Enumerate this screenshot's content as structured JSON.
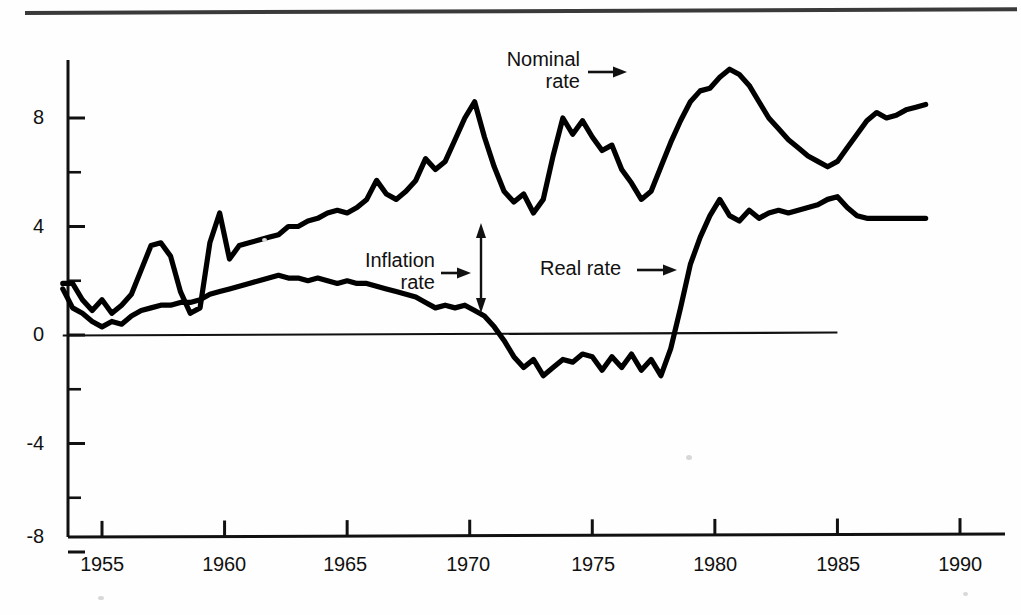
{
  "figure": {
    "has_top_rule": true,
    "background_color": "#fefefe",
    "line_color": "#000000",
    "axis_color": "#111111"
  },
  "annotations": [
    {
      "name": "nominal-rate",
      "line1": "Nominal",
      "line2": "rate",
      "arrow": "right-arrow"
    },
    {
      "name": "inflation-rate",
      "line1": "Inflation",
      "line2": "rate",
      "arrow": "right-arrow"
    },
    {
      "name": "real-rate",
      "line1": "Real rate",
      "line2": "",
      "arrow": "right-arrow"
    }
  ],
  "chart_data": {
    "type": "line",
    "title": "",
    "subtitle": "",
    "xlabel": "",
    "ylabel": "",
    "xlim": [
      1953.4,
      1990.0
    ],
    "ylim": [
      -8,
      10
    ],
    "grid": false,
    "legend": "inline-annotations",
    "x_ticks": [
      1955,
      1960,
      1965,
      1970,
      1975,
      1980,
      1985,
      1990
    ],
    "x_tick_labels": [
      "1955",
      "1960",
      "1965",
      "1970",
      "1975",
      "1980",
      "1985",
      "1990"
    ],
    "y_ticks": [
      -8,
      -6,
      -4,
      -2,
      0,
      2,
      4,
      6,
      8
    ],
    "y_tick_labels": [
      "-8",
      "",
      "-4",
      "",
      "0",
      "",
      "4",
      "",
      "8"
    ],
    "y_major_labeled": [
      "8",
      "4",
      "0",
      "-4",
      "-8"
    ],
    "zero_line": {
      "value": 0,
      "x_start": 1953.4,
      "x_end": 1985.0
    },
    "series": [
      {
        "name": "Nominal rate",
        "x": [
          1953.4,
          1953.8,
          1954.2,
          1954.6,
          1955.0,
          1955.4,
          1955.8,
          1956.2,
          1956.6,
          1957.0,
          1957.4,
          1957.8,
          1958.2,
          1958.6,
          1959.0,
          1959.4,
          1959.8,
          1960.2,
          1960.6,
          1961.0,
          1961.4,
          1961.8,
          1962.2,
          1962.6,
          1963.0,
          1963.4,
          1963.8,
          1964.2,
          1964.6,
          1965.0,
          1965.4,
          1965.8,
          1966.2,
          1966.6,
          1967.0,
          1967.4,
          1967.8,
          1968.2,
          1968.6,
          1969.0,
          1969.4,
          1969.8,
          1970.2,
          1970.6,
          1971.0,
          1971.4,
          1971.8,
          1972.2,
          1972.6,
          1973.0,
          1973.4,
          1973.8,
          1974.2,
          1974.6,
          1975.0,
          1975.4,
          1975.8,
          1976.2,
          1976.6,
          1977.0,
          1977.4,
          1977.8,
          1978.2,
          1978.6,
          1979.0,
          1979.4,
          1979.8,
          1980.2,
          1980.6,
          1981.0,
          1981.4,
          1981.8,
          1982.2,
          1982.6,
          1983.0,
          1983.4,
          1983.8,
          1984.2,
          1984.6,
          1985.0,
          1985.4,
          1985.8,
          1986.2,
          1986.6,
          1987.0,
          1987.4,
          1987.8,
          1988.2,
          1988.6
        ],
        "y": [
          1.9,
          1.9,
          1.3,
          0.9,
          1.3,
          0.8,
          1.1,
          1.5,
          2.4,
          3.3,
          3.4,
          2.9,
          1.6,
          0.8,
          1.0,
          3.4,
          4.5,
          2.8,
          3.3,
          3.4,
          3.5,
          3.6,
          3.7,
          4.0,
          4.0,
          4.2,
          4.3,
          4.5,
          4.6,
          4.5,
          4.7,
          5.0,
          5.7,
          5.2,
          5.0,
          5.3,
          5.7,
          6.5,
          6.1,
          6.4,
          7.2,
          8.0,
          8.6,
          7.3,
          6.2,
          5.3,
          4.9,
          5.2,
          4.5,
          5.0,
          6.6,
          8.0,
          7.4,
          7.9,
          7.3,
          6.8,
          7.0,
          6.1,
          5.6,
          5.0,
          5.3,
          6.2,
          7.1,
          7.9,
          8.6,
          9.0,
          9.1,
          9.5,
          9.8,
          9.6,
          9.2,
          8.6,
          8.0,
          7.6,
          7.2,
          6.9,
          6.6,
          6.4,
          6.2,
          6.4,
          6.9,
          7.4,
          7.9,
          8.2,
          8.0,
          8.1,
          8.3,
          8.4,
          8.5
        ]
      },
      {
        "name": "Inflation rate / Real rate boundary series",
        "x": [
          1953.4,
          1953.8,
          1954.2,
          1954.6,
          1955.0,
          1955.4,
          1955.8,
          1956.2,
          1956.6,
          1957.0,
          1957.4,
          1957.8,
          1958.2,
          1958.6,
          1959.0,
          1959.4,
          1959.8,
          1960.2,
          1960.6,
          1961.0,
          1961.4,
          1961.8,
          1962.2,
          1962.6,
          1963.0,
          1963.4,
          1963.8,
          1964.2,
          1964.6,
          1965.0,
          1965.4,
          1965.8,
          1966.2,
          1966.6,
          1967.0,
          1967.4,
          1967.8,
          1968.2,
          1968.6,
          1969.0,
          1969.4,
          1969.8,
          1970.2,
          1970.6,
          1971.0,
          1971.4,
          1971.8,
          1972.2,
          1972.6,
          1973.0,
          1973.4,
          1973.8,
          1974.2,
          1974.6,
          1975.0,
          1975.4,
          1975.8,
          1976.2,
          1976.6,
          1977.0,
          1977.4,
          1977.8,
          1978.2,
          1978.6,
          1979.0,
          1979.4,
          1979.8,
          1980.2,
          1980.6,
          1981.0,
          1981.4,
          1981.8,
          1982.2,
          1982.6,
          1983.0,
          1983.4,
          1983.8,
          1984.2,
          1984.6,
          1985.0,
          1985.4,
          1985.8,
          1986.2,
          1986.6,
          1987.0,
          1987.4,
          1987.8,
          1988.2,
          1988.6
        ],
        "y": [
          1.7,
          1.0,
          0.8,
          0.5,
          0.3,
          0.5,
          0.4,
          0.7,
          0.9,
          1.0,
          1.1,
          1.1,
          1.2,
          1.2,
          1.3,
          1.5,
          1.6,
          1.7,
          1.8,
          1.9,
          2.0,
          2.1,
          2.2,
          2.1,
          2.1,
          2.0,
          2.1,
          2.0,
          1.9,
          2.0,
          1.9,
          1.9,
          1.8,
          1.7,
          1.6,
          1.5,
          1.4,
          1.2,
          1.0,
          1.1,
          1.0,
          1.1,
          0.9,
          0.7,
          0.3,
          -0.2,
          -0.8,
          -1.2,
          -0.9,
          -1.5,
          -1.2,
          -0.9,
          -1.0,
          -0.7,
          -0.8,
          -1.3,
          -0.8,
          -1.2,
          -0.7,
          -1.3,
          -0.9,
          -1.5,
          -0.5,
          1.0,
          2.6,
          3.6,
          4.4,
          5.0,
          4.4,
          4.2,
          4.6,
          4.3,
          4.5,
          4.6,
          4.5,
          4.6,
          4.7,
          4.8,
          5.0,
          5.1,
          4.7,
          4.4,
          4.3,
          4.3,
          4.3,
          4.3,
          4.3,
          4.3,
          4.3
        ]
      }
    ],
    "notes": {
      "nominal_peak_1968": 8.6,
      "nominal_peak_1981": 9.8,
      "nominal_trough_1984": 6.2,
      "real_min_1970s": -1.5,
      "real_level_1980s": 4.5,
      "real_rate_is_lower_curve": true,
      "inflation_gap_marker_year": 1970.6
    }
  }
}
